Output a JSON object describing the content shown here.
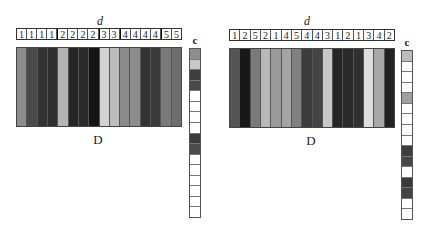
{
  "panels": [
    {
      "d_label": "d",
      "D_label": "D",
      "c_label": "c",
      "header": [
        "1",
        "1",
        "1",
        "1",
        "2",
        "2",
        "2",
        "2",
        "3",
        "3",
        "4",
        "4",
        "4",
        "4",
        "5",
        "5"
      ],
      "columns": [
        "#8c8c8c",
        "#4a4a4a",
        "#333333",
        "#2e2e2e",
        "#b4b4b4",
        "#262626",
        "#2b2b2b",
        "#141414",
        "#d2d2d2",
        "#bcbcbc",
        "#8a8a8a",
        "#8c8c8c",
        "#333333",
        "#3a3a3a",
        "#7a7a7a",
        "#6e6e6e"
      ],
      "c_cells": [
        "#8e8e8e",
        "#c8c8c8",
        "#3e3e3e",
        "#4a4a4a",
        "#ffffff",
        "#ffffff",
        "#ffffff",
        "#ffffff",
        "#3c3c3c",
        "#4c4c4c",
        "#ffffff",
        "#ffffff",
        "#ffffff",
        "#ffffff",
        "#ffffff",
        "#ffffff"
      ]
    },
    {
      "d_label": "d",
      "D_label": "D",
      "c_label": "c",
      "header": [
        "1",
        "2",
        "5",
        "2",
        "1",
        "4",
        "5",
        "4",
        "4",
        "3",
        "1",
        "2",
        "1",
        "3",
        "4",
        "2"
      ],
      "columns": [
        "#555555",
        "#181818",
        "#7a7a7a",
        "#b8b8b8",
        "#9a9a9a",
        "#a4a4a4",
        "#808080",
        "#3c3c3c",
        "#444444",
        "#c8c8c8",
        "#262626",
        "#2a2a2a",
        "#303030",
        "#dedede",
        "#a8a8a8",
        "#222222"
      ],
      "c_cells": [
        "#bdbdbd",
        "#ffffff",
        "#ffffff",
        "#ffffff",
        "#a0a0a0",
        "#ffffff",
        "#ffffff",
        "#ffffff",
        "#ffffff",
        "#3e3e3e",
        "#484848",
        "#ffffff",
        "#3a3a3a",
        "#444444",
        "#ffffff",
        "#ffffff"
      ]
    }
  ]
}
